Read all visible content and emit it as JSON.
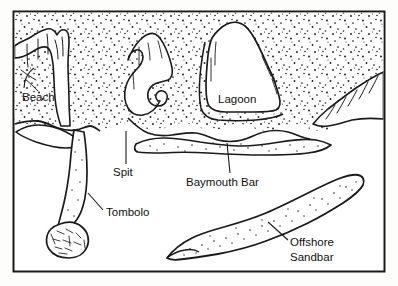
{
  "figure": {
    "type": "line-drawing",
    "frame": {
      "x": 13,
      "y": 11,
      "width": 372,
      "height": 261,
      "stroke_color": "#1a1a1a",
      "stroke_width": 2,
      "fill_color": "#ffffff"
    },
    "palette": {
      "ink": "#111111",
      "line": "#1a1a1a",
      "stipple": "#1a1a1a",
      "water": "#ffffff",
      "land": "#ffffff",
      "page_background": "#fdfdfc"
    }
  },
  "labels": {
    "beach": {
      "text": "Beach",
      "x": 22,
      "y": 101
    },
    "spit": {
      "text": "Spit",
      "x": 113,
      "y": 176
    },
    "lagoon": {
      "text": "Lagoon",
      "x": 218,
      "y": 103
    },
    "baymouth_bar": {
      "text": "Baymouth Bar",
      "x": 186,
      "y": 186
    },
    "tombolo": {
      "text": "Tombolo",
      "x": 106,
      "y": 216
    },
    "offshore_sandbar_line1": {
      "text": "Offshore",
      "x": 290,
      "y": 246
    },
    "offshore_sandbar_line2": {
      "text": "Sandbar",
      "x": 290,
      "y": 261
    }
  },
  "features": [
    {
      "name": "beach",
      "label": "Beach",
      "description": "sandy shore strip along headland"
    },
    {
      "name": "spit",
      "label": "Spit",
      "description": "curved hooked sand ridge extending from headland"
    },
    {
      "name": "lagoon",
      "label": "Lagoon",
      "description": "enclosed water body behind baymouth bar"
    },
    {
      "name": "baymouth-bar",
      "label": "Baymouth Bar",
      "description": "sand bar closing off a bay"
    },
    {
      "name": "tombolo",
      "label": "Tombolo",
      "description": "sand neck joining island to mainland"
    },
    {
      "name": "offshore-sandbar",
      "label": "Offshore Sandbar",
      "description": "elongate submerged sand ridge offshore"
    }
  ]
}
